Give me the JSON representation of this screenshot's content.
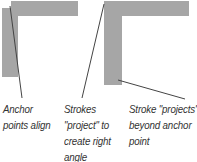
{
  "colors": {
    "stroke_fill": "#a6a6a6",
    "leader_line": "#444444",
    "text": "#333333",
    "background": "#ffffff"
  },
  "figures": [
    {
      "id": "left",
      "description": "Two separate strokes; anchor points align",
      "label_lines": [
        "Anchor",
        "points align"
      ]
    },
    {
      "id": "middle",
      "description": "Strokes project to create right angle",
      "label_lines": [
        "Strokes",
        "\"project\" to",
        "create right",
        "angle"
      ]
    },
    {
      "id": "right",
      "description": "Stroke projects beyond anchor point",
      "label_lines": [
        "Stroke \"projects\"",
        "beyond anchor",
        "point"
      ]
    }
  ]
}
